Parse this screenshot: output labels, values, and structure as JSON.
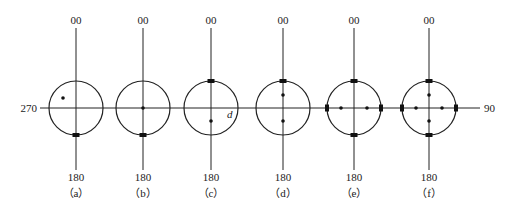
{
  "figure": {
    "axis": {
      "left_label": "270",
      "right_label": "90",
      "top_label": "00",
      "bottom_label": "180"
    },
    "panels": [
      {
        "id": "a",
        "caption": "（a）",
        "cx": 76,
        "dots": [
          [
            -13,
            -10
          ]
        ],
        "squares": [
          "bottom"
        ],
        "extra_label": ""
      },
      {
        "id": "b",
        "caption": "（b）",
        "cx": 143,
        "dots": [
          [
            0,
            0
          ]
        ],
        "squares": [
          "bottom"
        ],
        "extra_label": ""
      },
      {
        "id": "c",
        "caption": "（c）",
        "cx": 211,
        "dots": [
          [
            0,
            13
          ]
        ],
        "squares": [
          "top"
        ],
        "extra_label": "d"
      },
      {
        "id": "d",
        "caption": "（d）",
        "cx": 283,
        "dots": [
          [
            0,
            -13
          ],
          [
            0,
            13
          ]
        ],
        "squares": [
          "top"
        ],
        "extra_label": ""
      },
      {
        "id": "e",
        "caption": "（e）",
        "cx": 354,
        "dots": [
          [
            -13,
            0
          ],
          [
            13,
            0
          ]
        ],
        "squares": [
          "top",
          "bottom",
          "left",
          "right"
        ],
        "extra_label": ""
      },
      {
        "id": "f",
        "caption": "（f）",
        "cx": 429,
        "dots": [
          [
            -13,
            0
          ],
          [
            13,
            0
          ],
          [
            0,
            -13
          ],
          [
            0,
            13
          ]
        ],
        "squares": [
          "top",
          "bottom",
          "left",
          "right"
        ],
        "extra_label": ""
      }
    ],
    "colors": {
      "line": "#222222",
      "background": "#ffffff"
    }
  }
}
